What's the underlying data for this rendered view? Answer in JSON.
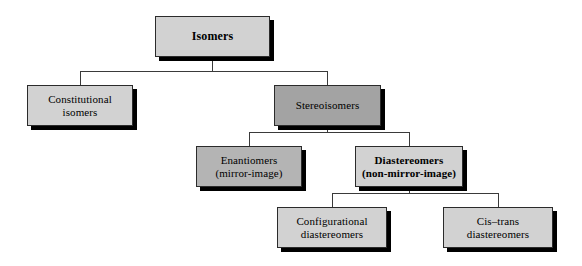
{
  "diagram": {
    "type": "hierarchy-tree",
    "colors": {
      "fill_light": "#d2d2d2",
      "fill_medium": "#b4b4b4",
      "fill_dark": "#a3a3a3",
      "border": "#2b2b2b",
      "shadow": "#000000",
      "background": "#ffffff",
      "text": "#000000"
    },
    "nodes": [
      {
        "id": "isomers",
        "label": "Isomers",
        "level": 0,
        "fill": "fill-light",
        "weight": "wt-bold",
        "font_size": 12,
        "x": 155,
        "y": 16,
        "w": 115,
        "h": 41
      },
      {
        "id": "constitutional-isomers",
        "label": "Constitutional\nisomers",
        "level": 1,
        "fill": "fill-light",
        "weight": "wt-normal",
        "font_size": 11,
        "x": 27,
        "y": 85,
        "w": 106,
        "h": 41
      },
      {
        "id": "stereoisomers",
        "label": "Stereoisomers",
        "level": 1,
        "fill": "fill-dark",
        "weight": "wt-normal",
        "font_size": 11,
        "x": 274,
        "y": 85,
        "w": 107,
        "h": 41
      },
      {
        "id": "enantiomers",
        "label": "Enantiomers\n(mirror-image)",
        "level": 2,
        "fill": "fill-medium",
        "weight": "wt-normal",
        "font_size": 11,
        "x": 196,
        "y": 146,
        "w": 106,
        "h": 41
      },
      {
        "id": "diastereomers",
        "label": "Diastereomers\n(non-mirror-image)",
        "level": 2,
        "fill": "fill-light",
        "weight": "wt-bold",
        "font_size": 11,
        "x": 355,
        "y": 146,
        "w": 108,
        "h": 41
      },
      {
        "id": "configurational-diastereomers",
        "label": "Configurational\ndiastereomers",
        "level": 3,
        "fill": "fill-light",
        "weight": "wt-normal",
        "font_size": 11,
        "x": 277,
        "y": 207,
        "w": 110,
        "h": 41
      },
      {
        "id": "cis-trans-diastereomers",
        "label": "Cis–trans\ndiastereomers",
        "level": 3,
        "fill": "fill-light",
        "weight": "wt-normal",
        "font_size": 11,
        "x": 443,
        "y": 207,
        "w": 110,
        "h": 41
      }
    ],
    "edges": [
      {
        "id": "isomers-to-constitutional",
        "from": "isomers",
        "to": "constitutional-isomers"
      },
      {
        "id": "isomers-to-stereoisomers",
        "from": "isomers",
        "to": "stereoisomers"
      },
      {
        "id": "stereoisomers-to-enantiomers",
        "from": "stereoisomers",
        "to": "enantiomers"
      },
      {
        "id": "stereoisomers-to-diastereomers",
        "from": "stereoisomers",
        "to": "diastereomers"
      },
      {
        "id": "diastereomers-to-configurational",
        "from": "diastereomers",
        "to": "configurational-diastereomers"
      },
      {
        "id": "diastereomers-to-cis-trans",
        "from": "diastereomers",
        "to": "cis-trans-diastereomers"
      }
    ]
  }
}
